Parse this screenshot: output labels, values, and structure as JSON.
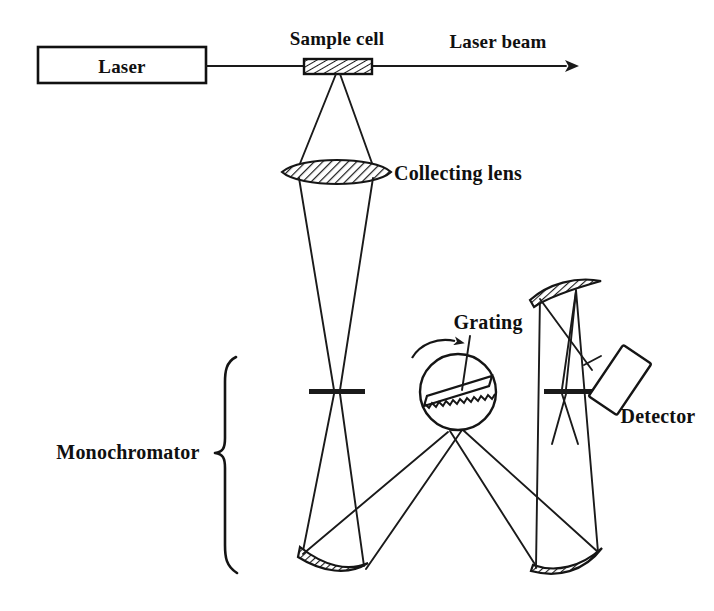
{
  "figure": {
    "domain": "diagram",
    "title_text": "",
    "background_color": "#ffffff",
    "ink_color": "#1a1a1a",
    "width": 714,
    "height": 611
  },
  "labels": {
    "laser": "Laser",
    "sample_cell": "Sample cell",
    "laser_beam": "Laser beam",
    "collecting_lens": "Collecting lens",
    "grating": "Grating",
    "detector": "Detector",
    "monochromator": "Monochromator"
  },
  "components": [
    {
      "name": "laser-source-box",
      "label": "Laser",
      "shape": "rectangle",
      "x": 38,
      "y": 47,
      "width": 168,
      "height": 36
    },
    {
      "name": "sample-cell",
      "label": "Sample cell",
      "shape": "hatched-rectangle",
      "x": 304,
      "y": 59,
      "width": 68,
      "height": 15
    },
    {
      "name": "laser-beam-arrow",
      "label": "Laser beam",
      "shape": "arrow",
      "x1": 206,
      "y1": 66,
      "x2": 582,
      "y2": 66
    },
    {
      "name": "collecting-lens",
      "label": "Collecting lens",
      "shape": "hatched-lens",
      "cx": 336,
      "cy": 172,
      "rx": 54,
      "ry": 15
    },
    {
      "name": "entrance-slit",
      "label": "",
      "shape": "slit-bar",
      "cx": 337,
      "cy": 392,
      "width": 56
    },
    {
      "name": "exit-slit",
      "label": "",
      "shape": "slit-bar",
      "cx": 570,
      "cy": 391,
      "width": 52
    },
    {
      "name": "diffraction-grating",
      "label": "Grating",
      "shape": "circle-with-sawtooth-bar",
      "cx": 458,
      "cy": 392,
      "r": 38,
      "bar_angle_deg": -17
    },
    {
      "name": "grating-rotation-arrow",
      "label": "",
      "shape": "curved-arrow"
    },
    {
      "name": "collimating-mirror-left",
      "label": "",
      "shape": "hatched-curved-mirror",
      "x1": 300,
      "y1": 549,
      "x2": 368,
      "y2": 568
    },
    {
      "name": "focusing-mirror-right",
      "label": "",
      "shape": "hatched-curved-mirror",
      "x1": 533,
      "y1": 568,
      "x2": 601,
      "y2": 549
    },
    {
      "name": "folding-mirror-upper-right",
      "label": "",
      "shape": "hatched-curved-mirror",
      "x1": 531,
      "y1": 299,
      "x2": 601,
      "y2": 284
    },
    {
      "name": "detector",
      "label": "Detector",
      "shape": "tilted-rectangle",
      "cx": 620,
      "cy": 380,
      "width": 34,
      "height": 62,
      "angle_deg": 35
    },
    {
      "name": "monochromator-brace",
      "label": "Monochromator",
      "shape": "curly-brace",
      "x": 222,
      "y_top": 356,
      "y_bottom": 574
    }
  ],
  "label_positions": {
    "laser": {
      "x": 122,
      "y": 72,
      "anchor": "middle"
    },
    "sample_cell": {
      "x": 337,
      "y": 45,
      "anchor": "middle"
    },
    "laser_beam": {
      "x": 498,
      "y": 48,
      "anchor": "middle"
    },
    "collecting_lens": {
      "x": 394,
      "y": 180,
      "anchor": "start"
    },
    "grating": {
      "x": 488,
      "y": 329,
      "anchor": "middle"
    },
    "detector": {
      "x": 658,
      "y": 423,
      "anchor": "middle"
    },
    "monochromator": {
      "x": 128,
      "y": 458,
      "anchor": "middle"
    }
  },
  "beam_paths": [
    {
      "name": "scatter-cone-to-lens",
      "from": "sample-cell",
      "to": "collecting-lens"
    },
    {
      "name": "lens-to-entrance-slit",
      "from": "collecting-lens",
      "to": "entrance-slit"
    },
    {
      "name": "slit-to-left-mirror",
      "from": "entrance-slit",
      "to": "collimating-mirror-left"
    },
    {
      "name": "left-mirror-to-grating",
      "from": "collimating-mirror-left",
      "to": "diffraction-grating"
    },
    {
      "name": "grating-to-right-mirror",
      "from": "diffraction-grating",
      "to": "focusing-mirror-right"
    },
    {
      "name": "right-mirror-to-fold-mirror",
      "from": "focusing-mirror-right",
      "to": "folding-mirror-upper-right"
    },
    {
      "name": "fold-mirror-to-exit-slit",
      "from": "folding-mirror-upper-right",
      "to": "exit-slit"
    },
    {
      "name": "exit-slit-to-detector",
      "from": "exit-slit",
      "to": "detector"
    }
  ]
}
